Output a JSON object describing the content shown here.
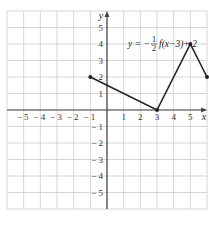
{
  "chart_data": {
    "type": "line",
    "title": "",
    "annotation": "y = -1/2 f(x-3) + 2",
    "annotation_parts": {
      "lhs": "y = −",
      "num": "1",
      "den": "2",
      "rhs": "f(x−3)+ 2"
    },
    "xlabel": "x",
    "ylabel": "y",
    "xlim": [
      -6,
      6
    ],
    "ylim": [
      -6,
      6
    ],
    "grid": true,
    "x_ticks": [
      -5,
      -4,
      -3,
      -2,
      -1,
      1,
      2,
      3,
      4,
      5
    ],
    "x_tick_labels": [
      "− 5",
      "− 4",
      "− 3",
      "− 2",
      "− 1",
      "1",
      "2",
      "3",
      "4",
      "5"
    ],
    "y_ticks": [
      5,
      4,
      3,
      2,
      1,
      -1,
      -2,
      -3,
      -4,
      -5
    ],
    "y_tick_labels": [
      "5",
      "4",
      "3",
      "2",
      "1",
      "− 1",
      "− 2",
      "− 3",
      "− 4",
      "− 5"
    ],
    "series": [
      {
        "name": "y = -1/2 f(x-3) + 2",
        "x": [
          -1,
          3,
          5,
          6
        ],
        "y": [
          2,
          0,
          4,
          2
        ]
      }
    ],
    "colors": {
      "grid": "#cccccc",
      "axis": "#444444",
      "line": "#222222"
    }
  }
}
